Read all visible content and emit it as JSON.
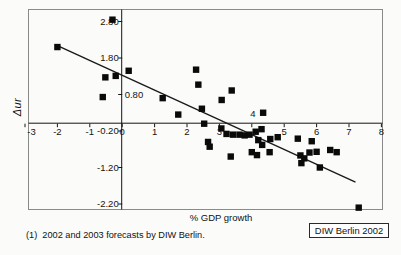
{
  "chart_data": {
    "type": "scatter",
    "title": "",
    "xlabel": "% GDP growth",
    "ylabel": "Δur",
    "xlim": [
      -3,
      8
    ],
    "ylim": [
      -2.36,
      3.13
    ],
    "grid": false,
    "legend": null,
    "axis_cross": {
      "x": 0,
      "y": 0
    },
    "marker": {
      "shape": "square",
      "color": "#0a0a0a",
      "size_px": 6.4
    },
    "line_color": "#1a1a1a",
    "frame_color": "#8a8a8a",
    "x_ticks": [
      {
        "value": -3,
        "label": "-3",
        "label_side": "below"
      },
      {
        "value": -2,
        "label": "-2",
        "label_side": "below"
      },
      {
        "value": -1,
        "label": "-1",
        "label_side": "below"
      },
      {
        "value": 0,
        "label": "0",
        "label_side": "below"
      },
      {
        "value": 1,
        "label": "1",
        "label_side": "below"
      },
      {
        "value": 2,
        "label": "2",
        "label_side": "below"
      },
      {
        "value": 3,
        "label": "3",
        "label_side": "below"
      },
      {
        "value": 4,
        "label": "4",
        "label_side": "above"
      },
      {
        "value": 5,
        "label": "5",
        "label_side": "below"
      },
      {
        "value": 6,
        "label": "6",
        "label_side": "below"
      },
      {
        "value": 7,
        "label": "7",
        "label_side": "below"
      },
      {
        "value": 8,
        "label": "8",
        "label_side": "below"
      }
    ],
    "y_ticks": [
      {
        "value": 2.8,
        "label": "2.80",
        "label_side": "left"
      },
      {
        "value": 1.8,
        "label": "1.80",
        "label_side": "left"
      },
      {
        "value": 0.8,
        "label": "0.80",
        "label_side": "right"
      },
      {
        "value": -0.2,
        "label": "-0.20",
        "label_side": "left"
      },
      {
        "value": -1.2,
        "label": "-1.20",
        "label_side": "left"
      },
      {
        "value": -2.2,
        "label": "-2.20",
        "label_side": "left"
      }
    ],
    "points": [
      [
        -2.0,
        2.1
      ],
      [
        -0.3,
        2.85
      ],
      [
        -0.52,
        1.27
      ],
      [
        -0.2,
        1.31
      ],
      [
        -0.6,
        0.73
      ],
      [
        0.2,
        1.45
      ],
      [
        1.25,
        0.7
      ],
      [
        1.73,
        0.25
      ],
      [
        2.28,
        1.48
      ],
      [
        2.35,
        1.07
      ],
      [
        2.46,
        0.41
      ],
      [
        2.53,
        0.0
      ],
      [
        3.07,
        0.65
      ],
      [
        3.38,
        0.91
      ],
      [
        3.06,
        -0.13
      ],
      [
        3.22,
        -0.28
      ],
      [
        3.42,
        -0.3
      ],
      [
        3.62,
        -0.3
      ],
      [
        3.78,
        -0.32
      ],
      [
        3.93,
        -0.3
      ],
      [
        4.12,
        -0.22
      ],
      [
        4.35,
        0.3
      ],
      [
        4.3,
        -0.15
      ],
      [
        2.65,
        -0.5
      ],
      [
        2.7,
        -0.63
      ],
      [
        3.35,
        -0.9
      ],
      [
        4.0,
        -0.78
      ],
      [
        4.16,
        -0.86
      ],
      [
        4.2,
        -0.45
      ],
      [
        4.32,
        -0.58
      ],
      [
        4.57,
        -0.42
      ],
      [
        4.55,
        -0.78
      ],
      [
        4.8,
        -0.37
      ],
      [
        5.42,
        -0.41
      ],
      [
        5.85,
        -0.48
      ],
      [
        5.5,
        -0.87
      ],
      [
        5.62,
        -0.95
      ],
      [
        5.53,
        -1.08
      ],
      [
        5.78,
        -0.79
      ],
      [
        6.0,
        -0.77
      ],
      [
        6.1,
        -1.2
      ],
      [
        6.42,
        -0.72
      ],
      [
        6.62,
        -0.78
      ],
      [
        7.3,
        -2.3
      ]
    ],
    "trend_line": {
      "x1": -2.05,
      "y1": 2.16,
      "x2": 7.2,
      "y2": -1.6
    }
  },
  "footnote": "(1)  2002 and 2003 forecasts by DIW Berlin.",
  "source_box_label": "DIW Berlin 2002"
}
